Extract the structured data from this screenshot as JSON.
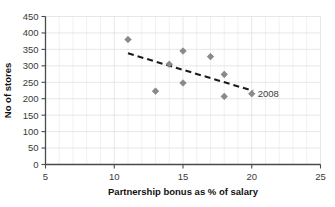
{
  "chart_data": {
    "type": "scatter",
    "title": "",
    "xlabel": "Partnership bonus as % of salary",
    "ylabel": "No of stores",
    "xlim": [
      5,
      25
    ],
    "ylim": [
      0,
      450
    ],
    "xticks": [
      5,
      10,
      15,
      20,
      25
    ],
    "yticks": [
      0,
      50,
      100,
      150,
      200,
      250,
      300,
      350,
      400,
      450
    ],
    "xtick_labels": [
      "5",
      "10",
      "15",
      "20",
      "25"
    ],
    "ytick_labels": [
      "0",
      "50",
      "100",
      "150",
      "200",
      "250",
      "300",
      "350",
      "400",
      "450"
    ],
    "x_minor_step": 1,
    "y_minor_step": 50,
    "grid": true,
    "legend": "none",
    "marker": "diamond",
    "marker_color": "#8a8a8a",
    "points": [
      {
        "x": 11,
        "y": 380,
        "label": ""
      },
      {
        "x": 13,
        "y": 223,
        "label": ""
      },
      {
        "x": 14,
        "y": 305,
        "label": ""
      },
      {
        "x": 15,
        "y": 345,
        "label": ""
      },
      {
        "x": 15,
        "y": 248,
        "label": ""
      },
      {
        "x": 17,
        "y": 328,
        "label": ""
      },
      {
        "x": 18,
        "y": 274,
        "label": ""
      },
      {
        "x": 18,
        "y": 207,
        "label": ""
      },
      {
        "x": 20,
        "y": 215,
        "label": "2008"
      }
    ],
    "annotations": [
      {
        "text": "2008",
        "x": 20,
        "y": 215
      }
    ],
    "trendline": {
      "type": "linear-dashed",
      "color": "#1b1b1b",
      "x_start": 11,
      "y_start": 338,
      "x_end": 20.1,
      "y_end": 224
    }
  }
}
